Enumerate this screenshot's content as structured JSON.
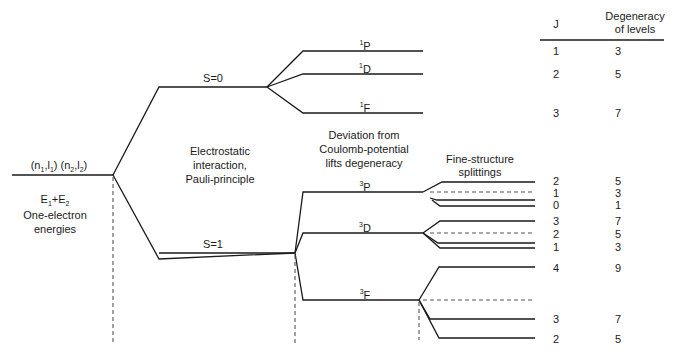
{
  "diagram": {
    "type": "energy-level-splitting",
    "left": {
      "config_label": "(n1,l1) (n2,l2)",
      "config_parts": [
        "(n",
        "1",
        ",l",
        "1",
        ") (n",
        "2",
        ",l",
        "2",
        ")"
      ],
      "energy_label": "E1+E2",
      "energy_parts": [
        "E",
        "1",
        "+E",
        "2"
      ],
      "caption_line1": "One-electron",
      "caption_line2": "energies"
    },
    "stage1": {
      "caption": [
        "Electrostatic",
        "interaction,",
        "Pauli-principle"
      ],
      "singlet_label": "S=0",
      "triplet_label": "S=1"
    },
    "stage2": {
      "caption": [
        "Deviation from",
        "Coulomb-potential",
        "lifts degeneracy"
      ],
      "terms": [
        {
          "mult": "1",
          "L": "P"
        },
        {
          "mult": "1",
          "L": "D"
        },
        {
          "mult": "1",
          "L": "F"
        },
        {
          "mult": "3",
          "L": "P"
        },
        {
          "mult": "3",
          "L": "D"
        },
        {
          "mult": "3",
          "L": "F"
        }
      ]
    },
    "stage3": {
      "caption": [
        "Fine-structure",
        "splittings"
      ]
    },
    "table": {
      "header_j": "J",
      "header_deg_line1": "Degeneracy",
      "header_deg_line2": "of levels",
      "rows": [
        {
          "term": "1P",
          "J": "1",
          "deg": "3"
        },
        {
          "term": "1D",
          "J": "2",
          "deg": "5"
        },
        {
          "term": "1F",
          "J": "3",
          "deg": "7"
        },
        {
          "term": "3P",
          "J": "2",
          "deg": "5"
        },
        {
          "term": "3P",
          "J": "1",
          "deg": "3"
        },
        {
          "term": "3P",
          "J": "0",
          "deg": "1"
        },
        {
          "term": "3D",
          "J": "3",
          "deg": "7"
        },
        {
          "term": "3D",
          "J": "2",
          "deg": "5"
        },
        {
          "term": "3D",
          "J": "1",
          "deg": "3"
        },
        {
          "term": "3F",
          "J": "4",
          "deg": "9"
        },
        {
          "term": "3F",
          "J": "3",
          "deg": "7"
        },
        {
          "term": "3F",
          "J": "2",
          "deg": "5"
        }
      ]
    },
    "colors": {
      "line": "#1a1a1a",
      "dashed": "#555555",
      "background": "#ffffff"
    }
  }
}
